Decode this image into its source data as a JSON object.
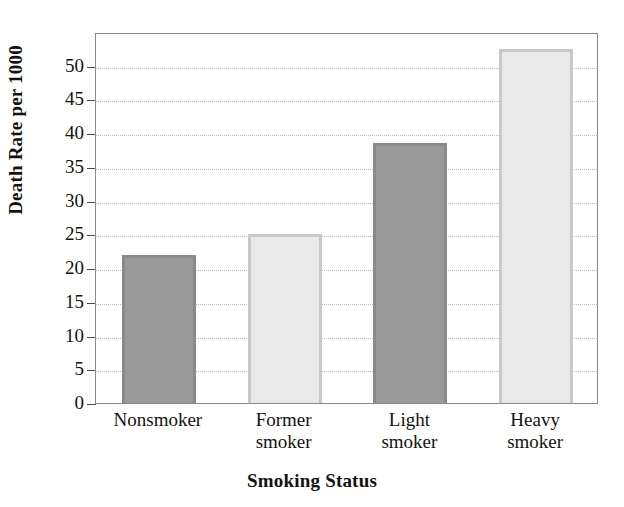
{
  "chart_data": {
    "type": "bar",
    "title": "",
    "xlabel": "Smoking Status",
    "ylabel": "Death Rate per 1000",
    "categories": [
      "Nonsmoker",
      "Former smoker",
      "Light smoker",
      "Heavy smoker"
    ],
    "category_lines": [
      [
        "Nonsmoker"
      ],
      [
        "Former",
        "smoker"
      ],
      [
        "Light",
        "smoker"
      ],
      [
        "Heavy",
        "smoker"
      ]
    ],
    "values": [
      22,
      25,
      38.5,
      52.5
    ],
    "ylim": [
      0,
      55
    ],
    "yticks": [
      0,
      5,
      10,
      15,
      20,
      25,
      30,
      35,
      40,
      45,
      50
    ],
    "ytick_labels": [
      "0",
      "5",
      "10",
      "15",
      "20",
      "25",
      "30",
      "35",
      "40",
      "45",
      "50"
    ],
    "grid": true,
    "grid_style": "dotted",
    "legend": "none",
    "bar_colors": [
      "#9a9a9a",
      "#e9e9e9",
      "#9a9a9a",
      "#e9e9e9"
    ],
    "bar_edge_colors": [
      "#8a8a8a",
      "#c9c9c9",
      "#8a8a8a",
      "#c9c9c9"
    ],
    "gridline_color": "#bdbdbd",
    "axis_color": "#8a8a8a",
    "text_color": "#15120f",
    "background": "#ffffff"
  }
}
